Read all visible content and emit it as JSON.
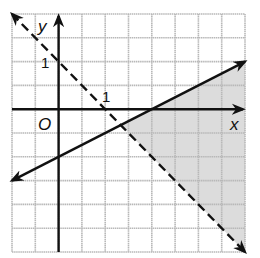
{
  "chart_data": {
    "type": "line",
    "title": "",
    "xlabel": "x",
    "ylabel": "y",
    "origin_label": "O",
    "xlim": [
      -2,
      8
    ],
    "ylim": [
      -6,
      4
    ],
    "grid": true,
    "tick_labels": {
      "x": [
        "1"
      ],
      "y": [
        "1"
      ]
    },
    "series": [
      {
        "name": "boundary-dashed",
        "equation": "y = -x + 2",
        "style": "dashed",
        "points": [
          [
            -2,
            4
          ],
          [
            8,
            -6
          ]
        ]
      },
      {
        "name": "boundary-solid",
        "equation": "y = x/2 - 2",
        "style": "solid",
        "points": [
          [
            -2,
            -3
          ],
          [
            8,
            2
          ]
        ]
      }
    ],
    "shaded_region": {
      "description": "y <= x/2 - 2 and y > -x + 2",
      "vertices": [
        [
          2.667,
          -0.667
        ],
        [
          8,
          2
        ],
        [
          8,
          -6
        ]
      ]
    }
  },
  "colors": {
    "grid": "#b8b8b8",
    "axis": "#111111",
    "shade": "#dcdcdc"
  }
}
